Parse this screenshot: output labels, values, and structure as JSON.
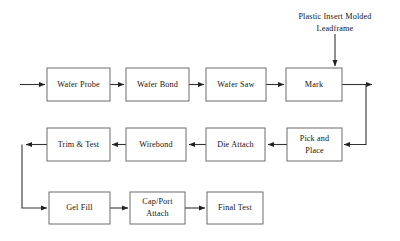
{
  "diagram": {
    "type": "flowchart",
    "background_color": "#ffffff",
    "box_border_color": "#6d6d6d",
    "box_fill_color": "#ffffff",
    "arrow_color": "#333333",
    "text_color": "#141414",
    "annotations": [
      {
        "id": "plastic-insert-molded-leadframe",
        "line1": "Plastic Insert Molded",
        "line2": "Leadframe",
        "target_node": "mark",
        "direction": "down"
      }
    ],
    "nodes": [
      {
        "id": "wafer-probe",
        "line1": "Wafer Probe",
        "line2": "",
        "row": 1,
        "x": 47,
        "y": 68,
        "w": 63,
        "h": 33
      },
      {
        "id": "wafer-bond",
        "line1": "Wafer Bond",
        "line2": "",
        "row": 1,
        "x": 126,
        "y": 68,
        "w": 63,
        "h": 33
      },
      {
        "id": "wafer-saw",
        "line1": "Wafer Saw",
        "line2": "",
        "row": 1,
        "x": 206,
        "y": 68,
        "w": 60,
        "h": 33
      },
      {
        "id": "mark",
        "line1": "Mark",
        "line2": "",
        "row": 1,
        "x": 286,
        "y": 68,
        "w": 56,
        "h": 33
      },
      {
        "id": "trim-and-test",
        "line1": "Trim & Test",
        "line2": "",
        "row": 2,
        "x": 47,
        "y": 128,
        "w": 63,
        "h": 33
      },
      {
        "id": "wirebond",
        "line1": "Wirebond",
        "line2": "",
        "row": 2,
        "x": 126,
        "y": 128,
        "w": 60,
        "h": 33
      },
      {
        "id": "die-attach",
        "line1": "Die Attach",
        "line2": "",
        "row": 2,
        "x": 206,
        "y": 128,
        "w": 59,
        "h": 33
      },
      {
        "id": "pick-and-place",
        "line1": "Pick and",
        "line2": "Place",
        "row": 2,
        "x": 287,
        "y": 128,
        "w": 55,
        "h": 33
      },
      {
        "id": "gel-fill",
        "line1": "Gel Fill",
        "line2": "",
        "row": 3,
        "x": 49,
        "y": 192,
        "w": 61,
        "h": 32
      },
      {
        "id": "cap-port-attach",
        "line1": "Cap/Port",
        "line2": "Attach",
        "row": 3,
        "x": 130,
        "y": 192,
        "w": 55,
        "h": 32
      },
      {
        "id": "final-test",
        "line1": "Final Test",
        "line2": "",
        "row": 3,
        "x": 207,
        "y": 192,
        "w": 56,
        "h": 32
      }
    ],
    "edges": [
      {
        "id": "edge-input-to-wafer-probe",
        "from": "input",
        "to": "wafer-probe"
      },
      {
        "id": "edge-wafer-probe-to-wafer-bond",
        "from": "wafer-probe",
        "to": "wafer-bond"
      },
      {
        "id": "edge-wafer-bond-to-wafer-saw",
        "from": "wafer-bond",
        "to": "wafer-saw"
      },
      {
        "id": "edge-wafer-saw-to-mark",
        "from": "wafer-saw",
        "to": "mark"
      },
      {
        "id": "edge-leadframe-to-mark",
        "from": "plastic-insert-molded-leadframe",
        "to": "mark"
      },
      {
        "id": "edge-mark-to-pick-and-place",
        "from": "mark",
        "to": "pick-and-place"
      },
      {
        "id": "edge-pick-and-place-to-die-attach",
        "from": "pick-and-place",
        "to": "die-attach"
      },
      {
        "id": "edge-die-attach-to-wirebond",
        "from": "die-attach",
        "to": "wirebond"
      },
      {
        "id": "edge-wirebond-to-trim-and-test",
        "from": "wirebond",
        "to": "trim-and-test"
      },
      {
        "id": "edge-trim-and-test-to-gel-fill",
        "from": "trim-and-test",
        "to": "gel-fill"
      },
      {
        "id": "edge-gel-fill-to-cap-port-attach",
        "from": "gel-fill",
        "to": "cap-port-attach"
      },
      {
        "id": "edge-cap-port-attach-to-final-test",
        "from": "cap-port-attach",
        "to": "final-test"
      }
    ]
  }
}
